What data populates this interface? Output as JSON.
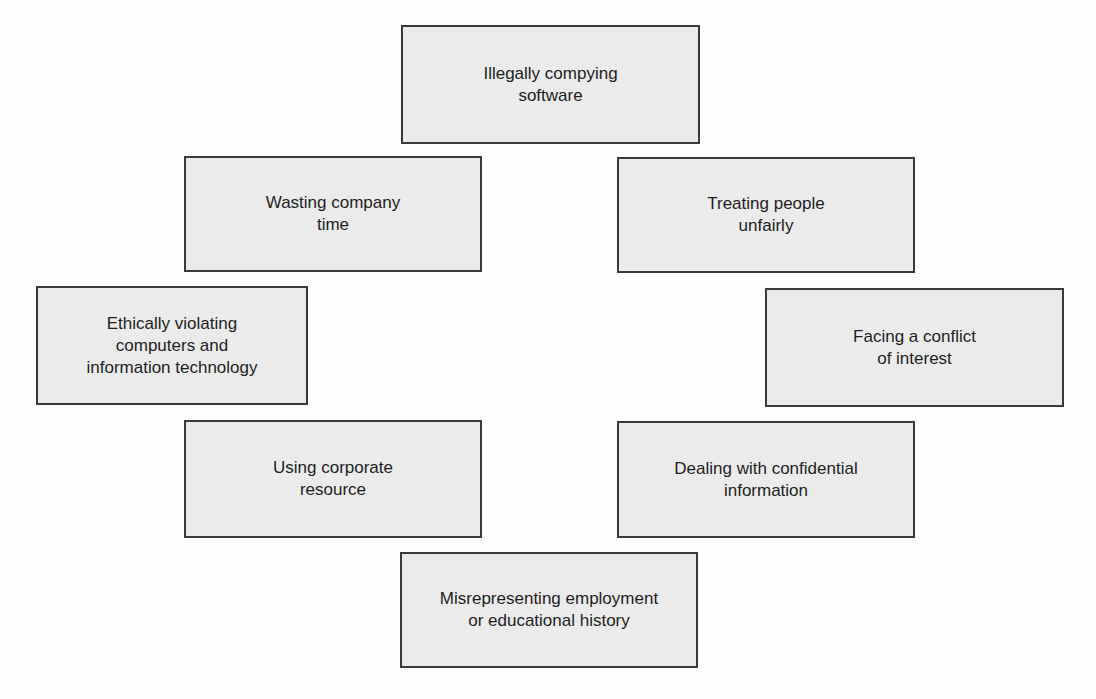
{
  "diagram": {
    "type": "ethical-issues-ring",
    "background_color": "#ffffff",
    "box_fill_color": "#ebebeb",
    "box_border_color": "#3a3a3a",
    "text_color": "#1e1e1e",
    "boxes": [
      {
        "id": "illegally-copying",
        "label": "Illegally compying\nsoftware"
      },
      {
        "id": "wasting-time",
        "label": "Wasting company\ntime"
      },
      {
        "id": "treating-unfairly",
        "label": "Treating people\nunfairly"
      },
      {
        "id": "ethically-violating",
        "label": "Ethically violating\ncomputers and\ninformation technology"
      },
      {
        "id": "conflict-of-interest",
        "label": "Facing a conflict\nof interest"
      },
      {
        "id": "corporate-resource",
        "label": "Using corporate\nresource"
      },
      {
        "id": "confidential-info",
        "label": "Dealing with confidential\ninformation"
      },
      {
        "id": "misrepresenting",
        "label": "Misrepresenting employment\nor educational history"
      }
    ]
  }
}
